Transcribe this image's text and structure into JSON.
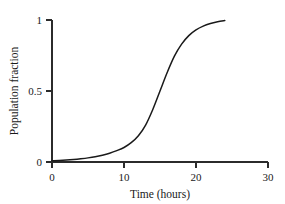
{
  "chart_data": {
    "type": "line",
    "title": "",
    "xlabel": "Time (hours)",
    "ylabel": "Population fraction",
    "xlim": [
      0,
      30
    ],
    "ylim": [
      0,
      1
    ],
    "xticks": [
      0,
      10,
      20,
      30
    ],
    "xtick_labels": [
      "0",
      "10",
      "20",
      "30"
    ],
    "yticks": [
      0,
      0.5,
      1
    ],
    "ytick_labels": [
      "0",
      "0.5",
      "1"
    ],
    "grid": false,
    "legend": false,
    "series": [
      {
        "name": "Population fraction",
        "color": "#1a1a1a",
        "x": [
          0,
          1,
          2,
          3,
          4,
          5,
          6,
          7,
          8,
          9,
          10,
          11,
          12,
          13,
          14,
          15,
          16,
          17,
          18,
          19,
          20,
          21,
          22,
          23,
          24
        ],
        "values": [
          0.009,
          0.011,
          0.014,
          0.018,
          0.023,
          0.029,
          0.037,
          0.048,
          0.062,
          0.08,
          0.102,
          0.136,
          0.185,
          0.26,
          0.37,
          0.5,
          0.63,
          0.745,
          0.83,
          0.89,
          0.93,
          0.957,
          0.975,
          0.987,
          0.996
        ]
      }
    ],
    "annotations": {
      "curve_shape": "sigmoid",
      "midpoint_time": 15,
      "plateau_value": 1,
      "curve_end_time": 24
    }
  },
  "axis": {
    "y_tick_0": "0",
    "y_tick_half": "0.5",
    "y_tick_one": "1",
    "x_tick_0": "0",
    "x_tick_10": "10",
    "x_tick_20": "20",
    "x_tick_30": "30",
    "x_title": "Time (hours)",
    "y_title": "Population fraction"
  },
  "colors": {
    "curve": "#1a1a1a",
    "axis": "#2b2b2b",
    "background": "#ffffff"
  }
}
